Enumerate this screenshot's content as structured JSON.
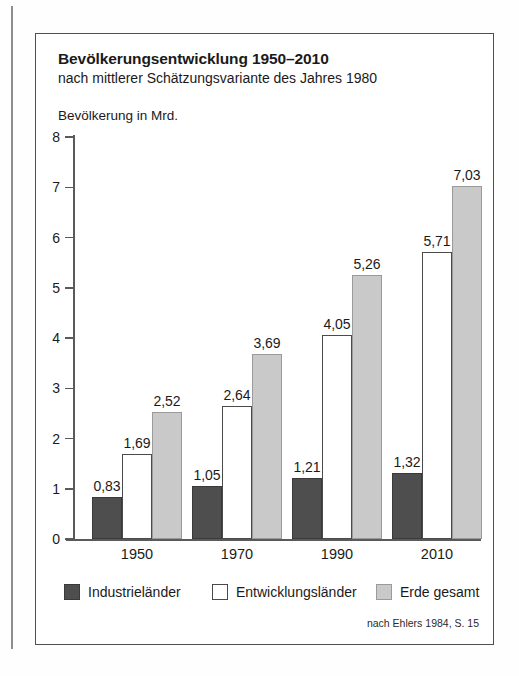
{
  "figure": {
    "title": "Bevölkerungsentwicklung 1950–2010",
    "subtitle": "nach mittlerer Schätzungsvariante des Jahres 1980",
    "source": "nach Ehlers 1984, S. 15"
  },
  "chart_data": {
    "type": "bar",
    "title": "Bevölkerungsentwicklung 1950–2010",
    "subtitle": "nach mittlerer Schätzungsvariante des Jahres 1980",
    "xlabel": "",
    "ylabel": "Bevölkerung in Mrd.",
    "ylim": [
      0,
      8
    ],
    "yticks": [
      "0",
      "1",
      "2",
      "3",
      "4",
      "5",
      "6",
      "7",
      "8"
    ],
    "grid": false,
    "legend_position": "bottom",
    "categories": [
      "1950",
      "1970",
      "1990",
      "2010"
    ],
    "series": [
      {
        "name": "Industrieländer",
        "color": "#4e4e4e",
        "values": [
          0.83,
          1.05,
          1.21,
          1.32
        ],
        "labels": [
          "0,83",
          "1,05",
          "1,21",
          "1,32"
        ]
      },
      {
        "name": "Entwicklungsländer",
        "color": "#ffffff",
        "values": [
          1.69,
          2.64,
          4.05,
          5.71
        ],
        "labels": [
          "1,69",
          "2,64",
          "4,05",
          "5,71"
        ]
      },
      {
        "name": "Erde gesamt",
        "color": "#c9c9c9",
        "values": [
          2.52,
          3.69,
          5.26,
          7.03
        ],
        "labels": [
          "2,52",
          "3,69",
          "5,26",
          "7,03"
        ]
      }
    ]
  }
}
